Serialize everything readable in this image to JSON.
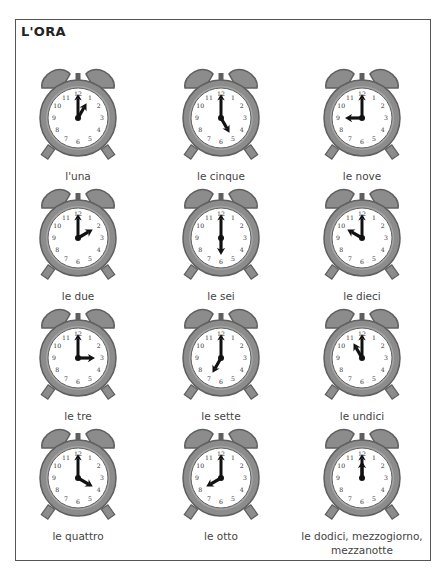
{
  "page": {
    "title": "L'ORA"
  },
  "colors": {
    "case": "#8c8c8c",
    "case_dark": "#5f5f5f",
    "face": "#ffffff",
    "hands": "#111111",
    "numerals": "#333333",
    "label": "#444444"
  },
  "clock_numerals": [
    "12",
    "1",
    "2",
    "3",
    "4",
    "5",
    "6",
    "7",
    "8",
    "9",
    "10",
    "11"
  ],
  "clocks": [
    {
      "label": "l'una",
      "hour": 1,
      "minute": 0
    },
    {
      "label": "le cinque",
      "hour": 5,
      "minute": 0
    },
    {
      "label": "le nove",
      "hour": 9,
      "minute": 0
    },
    {
      "label": "le due",
      "hour": 2,
      "minute": 0
    },
    {
      "label": "le sei",
      "hour": 6,
      "minute": 0
    },
    {
      "label": "le dieci",
      "hour": 10,
      "minute": 0
    },
    {
      "label": "le tre",
      "hour": 3,
      "minute": 0
    },
    {
      "label": "le sette",
      "hour": 7,
      "minute": 0
    },
    {
      "label": "le undici",
      "hour": 11,
      "minute": 0
    },
    {
      "label": "le quattro",
      "hour": 4,
      "minute": 0
    },
    {
      "label": "le otto",
      "hour": 8,
      "minute": 0
    },
    {
      "label": "le dodici, mezzogiorno, mezzanotte",
      "hour": 12,
      "minute": 0
    }
  ]
}
